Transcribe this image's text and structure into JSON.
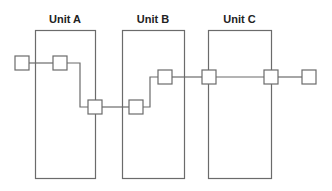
{
  "diagram": {
    "colors": {
      "stroke": "#6b6b6b",
      "text": "#222222",
      "background": "#ffffff",
      "node_fill": "#ffffff"
    },
    "units": [
      {
        "id": "A",
        "label": "Unit A",
        "x": 35,
        "y": 30,
        "w": 60,
        "h": 148
      },
      {
        "id": "B",
        "label": "Unit B",
        "x": 122,
        "y": 30,
        "w": 62,
        "h": 148
      },
      {
        "id": "C",
        "label": "Unit C",
        "x": 208,
        "y": 30,
        "w": 63,
        "h": 148
      }
    ],
    "nodes": [
      {
        "id": "n1",
        "cx": 22,
        "cy": 63
      },
      {
        "id": "n2",
        "cx": 60,
        "cy": 63
      },
      {
        "id": "n3",
        "cx": 95,
        "cy": 107
      },
      {
        "id": "n4",
        "cx": 136,
        "cy": 107
      },
      {
        "id": "n5",
        "cx": 165,
        "cy": 77
      },
      {
        "id": "n6",
        "cx": 209,
        "cy": 77
      },
      {
        "id": "n7",
        "cx": 271,
        "cy": 77
      },
      {
        "id": "n8",
        "cx": 309,
        "cy": 77
      }
    ],
    "node_size": 14,
    "wires": [
      {
        "from": "n1",
        "to": "n2",
        "points": "29,63 53,63"
      },
      {
        "from": "n2",
        "to": "n3",
        "points": "67,63 80,63 80,107 88,107"
      },
      {
        "from": "n3",
        "to": "n4",
        "points": "102,107 129,107"
      },
      {
        "from": "n4",
        "to": "n5",
        "points": "143,107 150,107 150,77 158,77"
      },
      {
        "from": "n5",
        "to": "n6",
        "points": "172,77 202,77"
      },
      {
        "from": "n6",
        "to": "n7",
        "points": "216,77 264,77"
      },
      {
        "from": "n7",
        "to": "n8",
        "points": "278,77 302,77"
      }
    ]
  }
}
